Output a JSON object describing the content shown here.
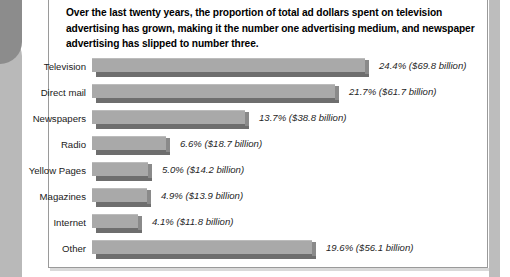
{
  "headline": "Over the last twenty years, the proportion of total ad dollars spent on television advertising has grown, making it the number one advertising medium, and newspaper advertising has slipped to number three.",
  "chart_data": {
    "type": "bar",
    "orientation": "horizontal",
    "title": "",
    "xlabel": "",
    "ylabel": "",
    "grid": false,
    "legend": "none",
    "xlim": [
      0,
      25
    ],
    "categories": [
      "Television",
      "Direct mail",
      "Newspapers",
      "Radio",
      "Yellow Pages",
      "Magazines",
      "Internet",
      "Other"
    ],
    "values": [
      24.4,
      21.7,
      13.7,
      6.6,
      5.0,
      4.9,
      4.1,
      19.6
    ],
    "dollars_billions": [
      69.8,
      61.7,
      38.8,
      18.7,
      14.2,
      13.9,
      11.8,
      56.1
    ],
    "value_labels": [
      "24.4% ($69.8 billion)",
      "21.7% ($61.7 billion)",
      "13.7% ($38.8 billion)",
      "6.6% ($18.7 billion)",
      "5.0% ($14.2 billion)",
      "4.9% ($13.9 billion)",
      "4.1% ($11.8 billion)",
      "19.6% ($56.1 billion)"
    ]
  },
  "colors": {
    "bar_face": "#a9a9a9",
    "bar_shadow": "#6e6e6e",
    "panel_border": "#9a9a9a",
    "text": "#000000",
    "page_edge": "#b9b9b9"
  }
}
